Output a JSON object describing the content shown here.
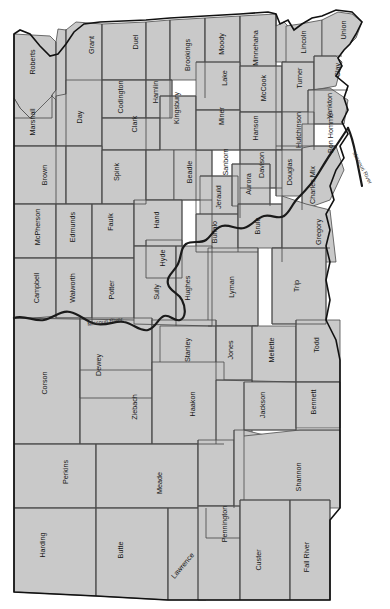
{
  "map": {
    "title": "South Dakota County Map",
    "colors": {
      "county_fill": "#c9c9c9",
      "county_border": "#4a4a4a",
      "state_outline": "#111111",
      "river": "#1a1a1a",
      "background": "#ffffff",
      "label_text": "#141414"
    },
    "label_rotation_deg": -90,
    "rivers": [
      {
        "name": "Missouri River",
        "label": "Missouri River",
        "x": 105,
        "y": 322,
        "rotate": -8
      },
      {
        "name": "Missouri River",
        "label": "Missouri River",
        "x": 362,
        "y": 168,
        "rotate": 62
      }
    ],
    "counties": [
      {
        "name": "Roberts",
        "label": "Roberts",
        "x": 33,
        "y": 62
      },
      {
        "name": "Grant",
        "label": "Grant",
        "x": 92,
        "y": 45
      },
      {
        "name": "Duel",
        "label": "Duel",
        "x": 136,
        "y": 42
      },
      {
        "name": "Brookings",
        "label": "Brookings",
        "x": 188,
        "y": 55
      },
      {
        "name": "Moody",
        "label": "Moody",
        "x": 222,
        "y": 44
      },
      {
        "name": "Minnehaha",
        "label": "Minnehaha",
        "x": 256,
        "y": 48
      },
      {
        "name": "Lincoln",
        "label": "Lincoln",
        "x": 304,
        "y": 42
      },
      {
        "name": "Union",
        "label": "Union",
        "x": 344,
        "y": 30
      },
      {
        "name": "Marshall",
        "label": "Marshall",
        "x": 33,
        "y": 122
      },
      {
        "name": "Day",
        "label": "Day",
        "x": 80,
        "y": 117
      },
      {
        "name": "Codington",
        "label": "Codington",
        "x": 121,
        "y": 97
      },
      {
        "name": "Hamlin",
        "label": "Hamlin",
        "x": 156,
        "y": 92
      },
      {
        "name": "Clark",
        "label": "Clark",
        "x": 135,
        "y": 124
      },
      {
        "name": "Kingsbury",
        "label": "Kingsbury",
        "x": 177,
        "y": 108
      },
      {
        "name": "Lake",
        "label": "Lake",
        "x": 225,
        "y": 78
      },
      {
        "name": "McCook",
        "label": "McCook",
        "x": 264,
        "y": 88
      },
      {
        "name": "Turner",
        "label": "Turner",
        "x": 300,
        "y": 78
      },
      {
        "name": "Clay",
        "label": "Clay",
        "x": 338,
        "y": 70
      },
      {
        "name": "Yankton",
        "label": "Yankton",
        "x": 330,
        "y": 106
      },
      {
        "name": "Brown",
        "label": "Brown",
        "x": 45,
        "y": 175
      },
      {
        "name": "Spink",
        "label": "Spink",
        "x": 117,
        "y": 172
      },
      {
        "name": "Beadle",
        "label": "Beadle",
        "x": 190,
        "y": 172
      },
      {
        "name": "Sanborn",
        "label": "Sanborn",
        "x": 226,
        "y": 162
      },
      {
        "name": "Miner",
        "label": "Miner",
        "x": 222,
        "y": 116
      },
      {
        "name": "Hanson",
        "label": "Hanson",
        "x": 256,
        "y": 128
      },
      {
        "name": "Davison",
        "label": "Davison",
        "x": 262,
        "y": 165
      },
      {
        "name": "Hutchinson",
        "label": "Hutchinson",
        "x": 299,
        "y": 130
      },
      {
        "name": "Bon Homme",
        "label": "Bon Homme",
        "x": 331,
        "y": 133
      },
      {
        "name": "Douglas",
        "label": "Douglas",
        "x": 290,
        "y": 172
      },
      {
        "name": "Charles Mix",
        "label": "Charles Mix",
        "x": 313,
        "y": 185
      },
      {
        "name": "McPherson",
        "label": "McPherson",
        "x": 38,
        "y": 227
      },
      {
        "name": "Edmunds",
        "label": "Edmunds",
        "x": 73,
        "y": 227
      },
      {
        "name": "Faulk",
        "label": "Faulk",
        "x": 111,
        "y": 222
      },
      {
        "name": "Hand",
        "label": "Hand",
        "x": 157,
        "y": 220
      },
      {
        "name": "Hyde",
        "label": "Hyde",
        "x": 163,
        "y": 258
      },
      {
        "name": "Jerauld",
        "label": "Jerauld",
        "x": 219,
        "y": 197
      },
      {
        "name": "Aurora",
        "label": "Aurora",
        "x": 249,
        "y": 184
      },
      {
        "name": "Buffalo",
        "label": "Buffalo",
        "x": 215,
        "y": 232
      },
      {
        "name": "Brule",
        "label": "Brule",
        "x": 258,
        "y": 226
      },
      {
        "name": "Gregory",
        "label": "Gregory",
        "x": 319,
        "y": 232
      },
      {
        "name": "Campbell",
        "label": "Campbell",
        "x": 37,
        "y": 288
      },
      {
        "name": "Walworth",
        "label": "Walworth",
        "x": 73,
        "y": 288
      },
      {
        "name": "Potter",
        "label": "Potter",
        "x": 112,
        "y": 290
      },
      {
        "name": "Sully",
        "label": "Sully",
        "x": 157,
        "y": 292
      },
      {
        "name": "Hughes",
        "label": "Hughes",
        "x": 188,
        "y": 288
      },
      {
        "name": "Lyman",
        "label": "Lyman",
        "x": 232,
        "y": 287
      },
      {
        "name": "Trip",
        "label": "Trip",
        "x": 297,
        "y": 286
      },
      {
        "name": "Dewey",
        "label": "Dewey",
        "x": 99,
        "y": 365
      },
      {
        "name": "Stanley",
        "label": "Stanley",
        "x": 188,
        "y": 350
      },
      {
        "name": "Jones",
        "label": "Jones",
        "x": 231,
        "y": 350
      },
      {
        "name": "Mellette",
        "label": "Mellette",
        "x": 272,
        "y": 350
      },
      {
        "name": "Todd",
        "label": "Todd",
        "x": 317,
        "y": 345
      },
      {
        "name": "Corson",
        "label": "Corson",
        "x": 45,
        "y": 383
      },
      {
        "name": "Ziebach",
        "label": "Ziebach",
        "x": 135,
        "y": 407
      },
      {
        "name": "Haakon",
        "label": "Haakon",
        "x": 193,
        "y": 404
      },
      {
        "name": "Jackson",
        "label": "Jackson",
        "x": 263,
        "y": 405
      },
      {
        "name": "Bennett",
        "label": "Bennett",
        "x": 314,
        "y": 402
      },
      {
        "name": "Perkins",
        "label": "Perkins",
        "x": 66,
        "y": 472
      },
      {
        "name": "Meade",
        "label": "Meade",
        "x": 160,
        "y": 483
      },
      {
        "name": "Pennington",
        "label": "Pennington",
        "x": 225,
        "y": 524
      },
      {
        "name": "Shannon",
        "label": "Shannon",
        "x": 299,
        "y": 477
      },
      {
        "name": "Harding",
        "label": "Harding",
        "x": 43,
        "y": 545
      },
      {
        "name": "Butte",
        "label": "Butte",
        "x": 121,
        "y": 550
      },
      {
        "name": "Lawrence",
        "label": "Lawrence",
        "x": 183,
        "y": 566,
        "rotate": -50
      },
      {
        "name": "Custer",
        "label": "Custer",
        "x": 259,
        "y": 560
      },
      {
        "name": "Fall River",
        "label": "Fall River",
        "x": 307,
        "y": 557
      }
    ]
  }
}
